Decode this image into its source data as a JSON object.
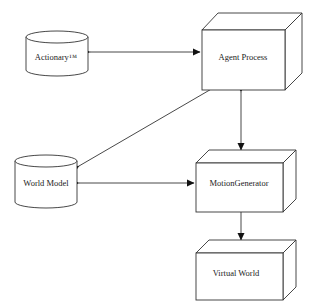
{
  "diagram": {
    "nodes": [
      {
        "id": "actionary",
        "label": "Actionary™",
        "shape": "cylinder"
      },
      {
        "id": "agent_process",
        "label": "Agent Process",
        "shape": "3d-box"
      },
      {
        "id": "world_model",
        "label": "World Model",
        "shape": "cylinder"
      },
      {
        "id": "motion_generator",
        "label": "MotionGenerator",
        "shape": "3d-box"
      },
      {
        "id": "virtual_world",
        "label": "Virtual World",
        "shape": "3d-box"
      }
    ],
    "edges": [
      {
        "from": "actionary",
        "to": "agent_process",
        "direction": "bidirectional"
      },
      {
        "from": "world_model",
        "to": "agent_process",
        "direction": "bidirectional"
      },
      {
        "from": "world_model",
        "to": "motion_generator",
        "direction": "bidirectional"
      },
      {
        "from": "agent_process",
        "to": "motion_generator",
        "direction": "bidirectional"
      },
      {
        "from": "motion_generator",
        "to": "virtual_world",
        "direction": "forward"
      }
    ]
  },
  "colors": {
    "stroke": "#333333",
    "background": "#ffffff"
  }
}
